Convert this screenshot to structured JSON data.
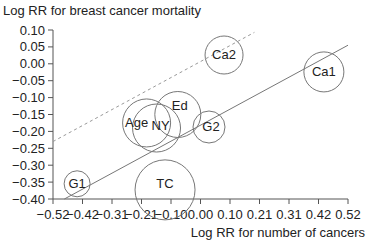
{
  "chart_data": {
    "type": "scatter",
    "title": "Log RR for breast cancer mortality",
    "ylabel": "Log RR for breast cancer mortality",
    "xlabel": "Log RR for number of cancers",
    "xlim": [
      -0.52,
      0.52
    ],
    "ylim": [
      -0.4,
      0.1
    ],
    "x_ticks": [
      "-0.52",
      "-0.42",
      "-0.31",
      "-0.21",
      "-0.10",
      "0.00",
      "0.10",
      "0.21",
      "0.31",
      "0.42",
      "0.52"
    ],
    "y_ticks": [
      "0.10",
      "0.05",
      "0.00",
      "-0.05",
      "-0.10",
      "-0.15",
      "-0.20",
      "-0.25",
      "-0.30",
      "-0.35",
      "-0.40"
    ],
    "grid": false,
    "points": [
      {
        "label": "G1",
        "x": -0.435,
        "y": -0.355,
        "size": 13
      },
      {
        "label": "TC",
        "x": -0.125,
        "y": -0.373,
        "size": 30
      },
      {
        "label": "Age",
        "x": -0.19,
        "y": -0.175,
        "size": 24
      },
      {
        "label": "NY",
        "x": -0.155,
        "y": -0.19,
        "size": 24
      },
      {
        "label": "Ed",
        "x": -0.08,
        "y": -0.15,
        "size": 23
      },
      {
        "label": "G2",
        "x": 0.03,
        "y": -0.187,
        "size": 16
      },
      {
        "label": "Ca2",
        "x": 0.083,
        "y": 0.026,
        "size": 19
      },
      {
        "label": "Ca1",
        "x": 0.435,
        "y": -0.024,
        "size": 20
      }
    ],
    "lines": [
      {
        "name": "regression",
        "style": "solid",
        "x": [
          -0.48,
          0.52
        ],
        "y": [
          -0.4,
          0.055
        ]
      },
      {
        "name": "upper-bound",
        "style": "dashed",
        "x": [
          -0.52,
          0.19
        ],
        "y": [
          -0.23,
          0.093
        ]
      }
    ]
  }
}
